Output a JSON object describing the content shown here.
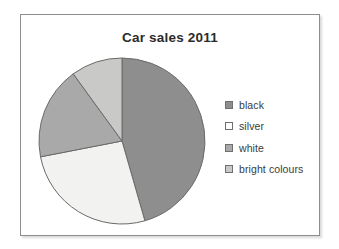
{
  "frame": {
    "border_color": "#8d8d8d",
    "background": "#ffffff"
  },
  "chart_data": {
    "type": "pie",
    "title": "Car sales 2011",
    "xlabel": "",
    "ylabel": "",
    "legend_position": "right",
    "grid": false,
    "start_angle_deg": 0,
    "direction": "clockwise",
    "categories": [
      "black",
      "silver",
      "white",
      "bright colours"
    ],
    "values": [
      46,
      26,
      18,
      10
    ],
    "unit": "percent",
    "slice_angles_deg": [
      164,
      95,
      65,
      36
    ],
    "slice_boundaries_deg": [
      36,
      200,
      295,
      360
    ],
    "colors": [
      "#8e8e8e",
      "#f2f2f0",
      "#a9a9a9",
      "#c9c9c7"
    ],
    "series": [
      {
        "name": "Car sales 2011",
        "values": [
          46,
          26,
          18,
          10
        ]
      }
    ]
  },
  "legend": {
    "items": [
      {
        "label": "black",
        "color": "#8e8e8e"
      },
      {
        "label": "silver",
        "color": "#fdfdfd"
      },
      {
        "label": "white",
        "color": "#a9a9a9"
      },
      {
        "label": "bright colours",
        "color": "#c9c9c7"
      }
    ]
  }
}
